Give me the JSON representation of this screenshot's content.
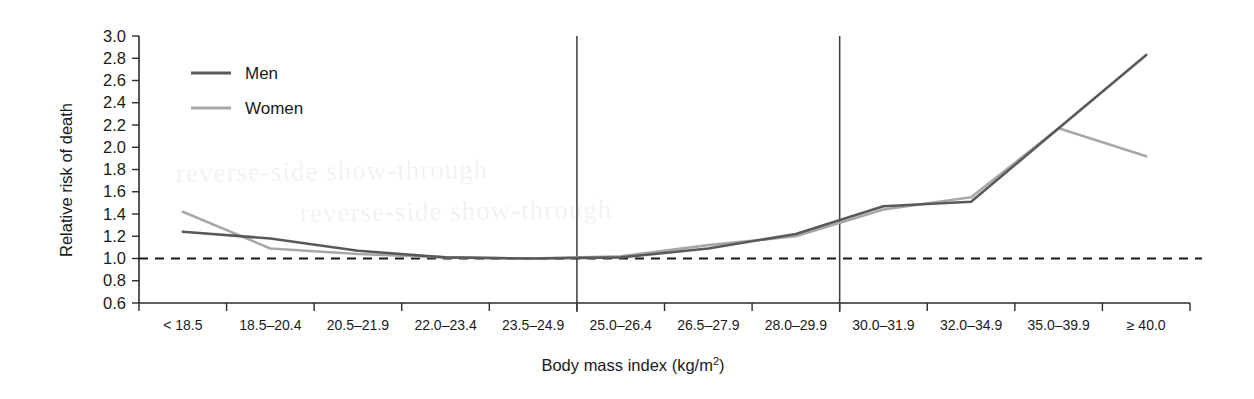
{
  "chart_data": {
    "type": "line",
    "title": "",
    "xlabel": "Body mass index (kg/m2)",
    "xlabel_base": "Body mass index (kg/m",
    "xlabel_sup": "2",
    "xlabel_close": ")",
    "ylabel": "Relative risk of death",
    "categories": [
      "< 18.5",
      "18.5–20.4",
      "20.5–21.9",
      "22.0–23.4",
      "23.5–24.9",
      "25.0–26.4",
      "26.5–27.9",
      "28.0–29.9",
      "30.0–31.9",
      "32.0–34.9",
      "35.0–39.9",
      "≥ 40.0"
    ],
    "series": [
      {
        "name": "Men",
        "color": "#595959",
        "values": [
          1.24,
          1.18,
          1.07,
          1.01,
          1.0,
          1.01,
          1.09,
          1.22,
          1.47,
          1.51,
          2.17,
          2.83
        ]
      },
      {
        "name": "Women",
        "color": "#a8a8a8",
        "values": [
          1.42,
          1.09,
          1.04,
          1.01,
          1.0,
          1.02,
          1.12,
          1.2,
          1.44,
          1.55,
          2.17,
          1.92
        ]
      }
    ],
    "ylim": [
      0.6,
      3.0
    ],
    "ytick_values": [
      3.0,
      2.8,
      2.6,
      2.4,
      2.2,
      2.0,
      1.8,
      1.6,
      1.4,
      1.2,
      1.0,
      0.8,
      0.6
    ],
    "ytick_labels": [
      "3.0",
      "2.8",
      "2.6",
      "2.4",
      "2.2",
      "2.0",
      "1.8",
      "1.6",
      "1.4",
      "1.2",
      "1.0",
      "0.8",
      "0.6"
    ],
    "reference_line": {
      "value": 1.0,
      "style": "dashed",
      "color": "#1a1a1a"
    },
    "vertical_reference_lines": [
      {
        "label": "25.0–26.4",
        "category_boundary_index": 5,
        "color": "#3b3b3b"
      },
      {
        "label": "30.0–31.9",
        "category_boundary_index": 8,
        "color": "#3b3b3b"
      }
    ],
    "grid": false,
    "legend_position": "top-left"
  },
  "ghost_text": {
    "line1": "reverse-side show-through",
    "line2": "reverse-side show-through"
  }
}
